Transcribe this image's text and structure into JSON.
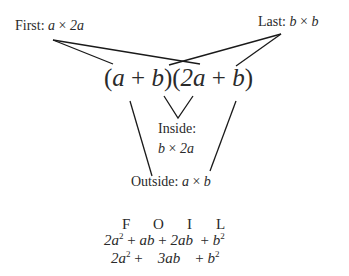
{
  "diagram": {
    "labels": {
      "first": {
        "prefix": "First: ",
        "term1": "a",
        "op": " × ",
        "term2": "2a"
      },
      "last": {
        "prefix": "Last: ",
        "term1": "b",
        "op": " × ",
        "term2": "b"
      },
      "inside": {
        "line1": "Inside:",
        "term1": "b",
        "op": " × ",
        "term2": "2a"
      },
      "outside": {
        "prefix": "Outside: ",
        "term1": "a",
        "op": " × ",
        "term2": "b"
      }
    },
    "expression": {
      "open1": "(",
      "a": "a",
      "plus1": " + ",
      "b1": "b",
      "close1": ")",
      "open2": "(",
      "twoa": "2a",
      "plus2": " + ",
      "b2": "b",
      "close2": ")"
    },
    "foil_header": [
      "F",
      "O",
      "I",
      "L"
    ],
    "expanded": {
      "t1": "2a",
      "t1_exp": "2",
      "p1": "+",
      "t2": "ab",
      "p2": "+",
      "t3": "2ab",
      "p3": "+",
      "t4": "b",
      "t4_exp": "2"
    },
    "simplified": {
      "t1": "2a",
      "t1_exp": "2",
      "p1": "+",
      "t2": "3ab",
      "p2": "+",
      "t3": "b",
      "t3_exp": "2"
    },
    "line_color": "#1a1a1a"
  }
}
